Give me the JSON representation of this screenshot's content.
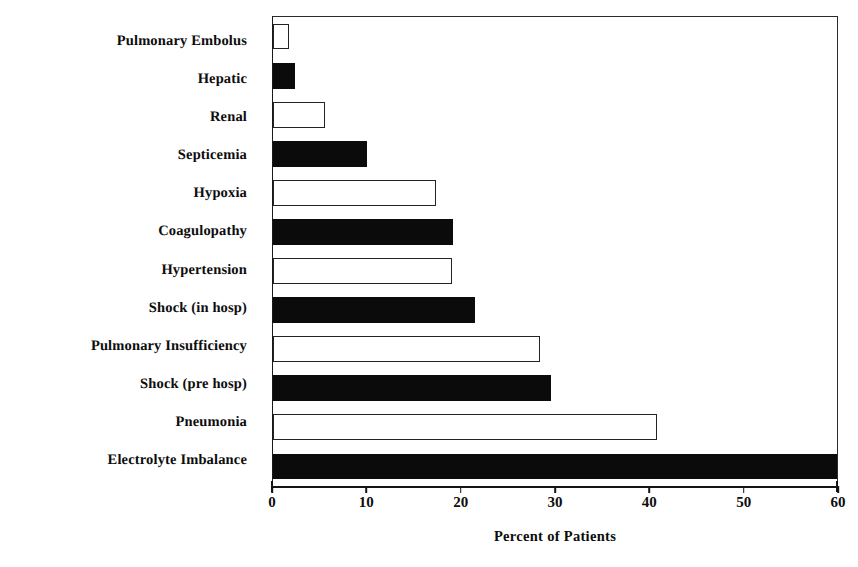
{
  "chart_data": {
    "type": "bar",
    "orientation": "horizontal",
    "title": "",
    "xlabel": "Percent of Patients",
    "ylabel": "",
    "xlim": [
      0,
      60
    ],
    "xticks": [
      0,
      10,
      20,
      30,
      40,
      50,
      60
    ],
    "xtick_labels": [
      "0",
      "10",
      "20",
      "30",
      "40",
      "50",
      "60"
    ],
    "grid": false,
    "legend": null,
    "categories": [
      "Pulmonary Embolus",
      "Hepatic",
      "Renal",
      "Septicemia",
      "Hypoxia",
      "Coagulopathy",
      "Hypertension",
      "Shock (in hosp)",
      "Pulmonary Insufficiency",
      "Shock (pre hosp)",
      "Pneumonia",
      "Electrolyte Imbalance"
    ],
    "values": [
      1.7,
      2.3,
      5.5,
      10.0,
      17.3,
      19.2,
      19.0,
      21.5,
      28.4,
      29.6,
      40.8,
      60.0
    ],
    "bar_styles": [
      "hollow",
      "filled",
      "hollow",
      "filled",
      "hollow",
      "filled",
      "hollow",
      "filled",
      "hollow",
      "filled",
      "hollow",
      "filled"
    ]
  },
  "colors": {
    "bar_fill": "#0b0b0b",
    "bar_outline": "#232323",
    "bar_hollow_fill": "#ffffff",
    "axis": "#151515",
    "text": "#0d0d0d",
    "background": "#ffffff"
  }
}
